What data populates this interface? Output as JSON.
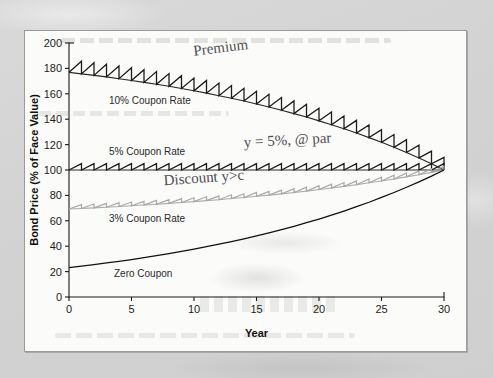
{
  "figure": {
    "panel_bg": "#fbfbfa",
    "page_bg": "#d7d7d7",
    "ink_dark": "#1b1b1b",
    "ink_gray": "#a8a8a8",
    "pencil": "#4e4e52"
  },
  "chart_data": {
    "type": "line",
    "title": "",
    "xlabel": "Year",
    "ylabel": "Bond Price (% of Face Value)",
    "xlim": [
      0,
      30
    ],
    "ylim": [
      0,
      200
    ],
    "xticks": [
      0,
      5,
      10,
      15,
      20,
      25,
      30
    ],
    "yticks": [
      0,
      20,
      40,
      60,
      80,
      100,
      120,
      140,
      160,
      180,
      200
    ],
    "grid": false,
    "legend": "inline-labels",
    "x": [
      0,
      1,
      2,
      3,
      4,
      5,
      6,
      7,
      8,
      9,
      10,
      11,
      12,
      13,
      14,
      15,
      16,
      17,
      18,
      19,
      20,
      21,
      22,
      23,
      24,
      25,
      26,
      27,
      28,
      29,
      30
    ],
    "series": [
      {
        "name": "10% Coupon Rate",
        "label": "10% Coupon Rate",
        "color": "#1b1b1b",
        "sawtooth": true,
        "coupon_rate": 10,
        "yield": 5,
        "values": [
          176.9,
          175.7,
          174.5,
          173.3,
          171.9,
          170.5,
          169.0,
          167.5,
          165.9,
          164.2,
          162.4,
          160.5,
          158.5,
          156.5,
          154.3,
          152.0,
          149.6,
          147.1,
          144.4,
          141.7,
          138.7,
          135.7,
          132.5,
          129.1,
          125.5,
          121.8,
          117.9,
          113.8,
          109.5,
          104.9,
          100.0
        ]
      },
      {
        "name": "5% Coupon Rate",
        "label": "5% Coupon Rate",
        "color": "#1b1b1b",
        "sawtooth": true,
        "coupon_rate": 5,
        "yield": 5,
        "values": [
          100,
          100,
          100,
          100,
          100,
          100,
          100,
          100,
          100,
          100,
          100,
          100,
          100,
          100,
          100,
          100,
          100,
          100,
          100,
          100,
          100,
          100,
          100,
          100,
          100,
          100,
          100,
          100,
          100,
          100,
          100
        ]
      },
      {
        "name": "3% Coupon Rate",
        "label": "3% Coupon Rate",
        "color": "#a8a8a8",
        "sawtooth": true,
        "coupon_rate": 3,
        "yield": 5,
        "values": [
          69.3,
          69.7,
          70.2,
          70.7,
          71.3,
          71.8,
          72.4,
          73.0,
          73.7,
          74.4,
          75.1,
          75.9,
          76.6,
          77.5,
          78.3,
          79.3,
          80.2,
          81.2,
          82.3,
          83.4,
          84.6,
          85.8,
          87.1,
          88.4,
          89.9,
          91.3,
          92.9,
          94.6,
          96.3,
          98.1,
          100.0
        ]
      },
      {
        "name": "Zero Coupon",
        "label": "Zero Coupon",
        "color": "#111111",
        "sawtooth": false,
        "coupon_rate": 0,
        "yield": 5,
        "values": [
          23.1,
          24.3,
          25.5,
          26.8,
          28.1,
          29.5,
          31.0,
          32.6,
          34.2,
          35.9,
          37.7,
          39.6,
          41.6,
          43.6,
          45.8,
          48.1,
          50.5,
          53.1,
          55.7,
          58.5,
          61.4,
          64.5,
          67.7,
          71.1,
          74.6,
          78.4,
          82.3,
          86.4,
          90.7,
          95.2,
          100.0
        ]
      }
    ],
    "curve_labels": [
      {
        "text": "10% Coupon Rate",
        "x": 3.2,
        "y": 152
      },
      {
        "text": "5% Coupon Rate",
        "x": 3.2,
        "y": 112
      },
      {
        "text": "3% Coupon Rate",
        "x": 3.2,
        "y": 59
      },
      {
        "text": "Zero Coupon",
        "x": 3.6,
        "y": 16
      }
    ],
    "annotations": [
      {
        "text": "Premium",
        "x": 10.0,
        "y": 190,
        "style": "handwritten",
        "rotate": -7
      },
      {
        "text": "y = 5%, @ par",
        "x": 14.0,
        "y": 118,
        "style": "handwritten",
        "rotate": -3
      },
      {
        "text": "Discount  y>c",
        "x": 7.6,
        "y": 88,
        "style": "handwritten",
        "rotate": -4
      }
    ]
  }
}
